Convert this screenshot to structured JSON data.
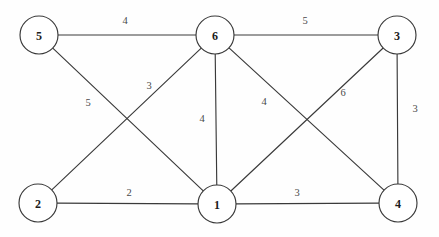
{
  "chart_data": {
    "type": "diagram",
    "subtype": "weighted-undirected-graph",
    "title": "",
    "canvas": {
      "width": 439,
      "height": 237,
      "background": "#fefefe"
    },
    "style": {
      "edge_color": "#3a3a3a",
      "node_fill": "#ffffff",
      "node_stroke": "#3a3a3a",
      "node_radius": 19,
      "label_color": "#1c1c1c",
      "weight_color": "#4a4a4a"
    },
    "nodes": [
      {
        "id": "5",
        "label": "5",
        "x": 39,
        "y": 35
      },
      {
        "id": "6",
        "label": "6",
        "x": 215,
        "y": 35
      },
      {
        "id": "3",
        "label": "3",
        "x": 397,
        "y": 35
      },
      {
        "id": "2",
        "label": "2",
        "x": 38,
        "y": 203
      },
      {
        "id": "1",
        "label": "1",
        "x": 217,
        "y": 204
      },
      {
        "id": "4",
        "label": "4",
        "x": 398,
        "y": 203
      }
    ],
    "edges": [
      {
        "source": "5",
        "target": "6",
        "weight": "4",
        "lx": 125,
        "ly": 20
      },
      {
        "source": "6",
        "target": "3",
        "weight": "5",
        "lx": 305,
        "ly": 20
      },
      {
        "source": "5",
        "target": "1",
        "weight": "5",
        "lx": 88,
        "ly": 102
      },
      {
        "source": "2",
        "target": "6",
        "weight": "3",
        "lx": 149,
        "ly": 85
      },
      {
        "source": "6",
        "target": "1",
        "weight": "4",
        "lx": 202,
        "ly": 118
      },
      {
        "source": "6",
        "target": "4",
        "weight": "4",
        "lx": 264,
        "ly": 101
      },
      {
        "source": "1",
        "target": "3",
        "weight": "6",
        "lx": 343,
        "ly": 92
      },
      {
        "source": "3",
        "target": "4",
        "weight": "3",
        "lx": 415,
        "ly": 108
      },
      {
        "source": "2",
        "target": "1",
        "weight": "2",
        "lx": 129,
        "ly": 192
      },
      {
        "source": "1",
        "target": "4",
        "weight": "3",
        "lx": 297,
        "ly": 192
      }
    ]
  }
}
